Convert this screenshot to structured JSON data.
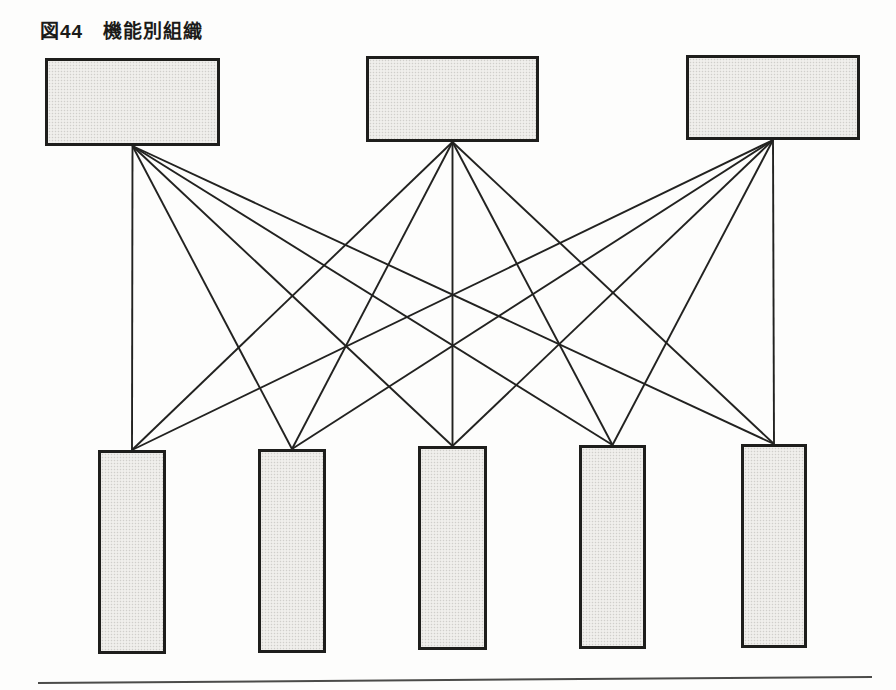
{
  "figure": {
    "title": "図44　機能別組織"
  },
  "diagram": {
    "top_boxes": [
      {
        "id": "top-box-1",
        "x": 45,
        "y": 58,
        "w": 175,
        "h": 88
      },
      {
        "id": "top-box-2",
        "x": 366,
        "y": 56,
        "w": 173,
        "h": 86
      },
      {
        "id": "top-box-3",
        "x": 686,
        "y": 55,
        "w": 174,
        "h": 85
      }
    ],
    "bottom_boxes": [
      {
        "id": "bottom-box-1",
        "x": 98,
        "y": 450,
        "w": 68,
        "h": 204
      },
      {
        "id": "bottom-box-2",
        "x": 258,
        "y": 449,
        "w": 68,
        "h": 204
      },
      {
        "id": "bottom-box-3",
        "x": 418,
        "y": 446,
        "w": 69,
        "h": 204
      },
      {
        "id": "bottom-box-4",
        "x": 579,
        "y": 445,
        "w": 67,
        "h": 204
      },
      {
        "id": "bottom-box-5",
        "x": 741,
        "y": 444,
        "w": 66,
        "h": 204
      }
    ],
    "edges": [
      {
        "from": "top-box-1",
        "to": "bottom-box-1"
      },
      {
        "from": "top-box-1",
        "to": "bottom-box-2"
      },
      {
        "from": "top-box-1",
        "to": "bottom-box-3"
      },
      {
        "from": "top-box-1",
        "to": "bottom-box-4"
      },
      {
        "from": "top-box-1",
        "to": "bottom-box-5"
      },
      {
        "from": "top-box-2",
        "to": "bottom-box-1"
      },
      {
        "from": "top-box-2",
        "to": "bottom-box-2"
      },
      {
        "from": "top-box-2",
        "to": "bottom-box-3"
      },
      {
        "from": "top-box-2",
        "to": "bottom-box-4"
      },
      {
        "from": "top-box-2",
        "to": "bottom-box-5"
      },
      {
        "from": "top-box-3",
        "to": "bottom-box-1"
      },
      {
        "from": "top-box-3",
        "to": "bottom-box-2"
      },
      {
        "from": "top-box-3",
        "to": "bottom-box-3"
      },
      {
        "from": "top-box-3",
        "to": "bottom-box-4"
      },
      {
        "from": "top-box-3",
        "to": "bottom-box-5"
      }
    ],
    "bottom_rule": {
      "x1": 38,
      "y1": 683,
      "x2": 872,
      "y2": 677
    }
  },
  "colors": {
    "page_bg": "#fdfdfc",
    "box_fill": "#f0efec",
    "box_border": "#1e1e1c",
    "connector_line": "#222220",
    "bottom_rule": "#4b4b49",
    "title_text": "#1b1b19"
  }
}
